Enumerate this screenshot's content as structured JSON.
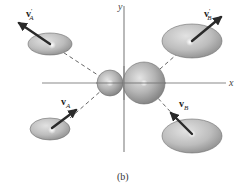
{
  "figure": {
    "caption": "(b)",
    "axes": {
      "x_label": "x",
      "y_label": "y",
      "axis_color": "#8a8a8a"
    },
    "colors": {
      "ellipse_fill_light": "#d4d4d4",
      "ellipse_fill_dark": "#9a9a9a",
      "ellipse_stroke": "#6f6f6f",
      "sphere_fill_light": "#e0e0e0",
      "sphere_fill_dark": "#8e8e8e",
      "arrow_color": "#2a2a2a",
      "dash_color": "#555555",
      "highlight": "#ffffff"
    },
    "spheres": [
      {
        "id": "A",
        "name": "small-sphere-A",
        "cx": 110,
        "cy": 83,
        "r": 13
      },
      {
        "id": "B",
        "name": "large-sphere-B",
        "cx": 144,
        "cy": 83,
        "r": 21
      }
    ],
    "bodies": [
      {
        "id": "A_prime",
        "position": "top-left",
        "cx": 50,
        "cy": 44,
        "rx": 22,
        "ry": 11
      },
      {
        "id": "B_prime",
        "position": "top-right",
        "cx": 192,
        "cy": 41,
        "rx": 30,
        "ry": 17
      },
      {
        "id": "A",
        "position": "bottom-left",
        "cx": 50,
        "cy": 129,
        "rx": 20,
        "ry": 11
      },
      {
        "id": "B",
        "position": "bottom-right",
        "cx": 192,
        "cy": 136,
        "rx": 30,
        "ry": 17
      }
    ],
    "vectors": [
      {
        "id": "vA_prime",
        "symbol": "v",
        "subscript": "A",
        "prime": "'",
        "label_full": "v'_A",
        "direction": "up-left"
      },
      {
        "id": "vB_prime",
        "symbol": "v",
        "subscript": "B",
        "prime": "'",
        "label_full": "v'_B",
        "direction": "up-right"
      },
      {
        "id": "vA",
        "symbol": "v",
        "subscript": "A",
        "prime": "",
        "label_full": "v_A",
        "direction": "up-right"
      },
      {
        "id": "vB",
        "symbol": "v",
        "subscript": "B",
        "prime": "",
        "label_full": "v_B",
        "direction": "up-left"
      }
    ]
  }
}
